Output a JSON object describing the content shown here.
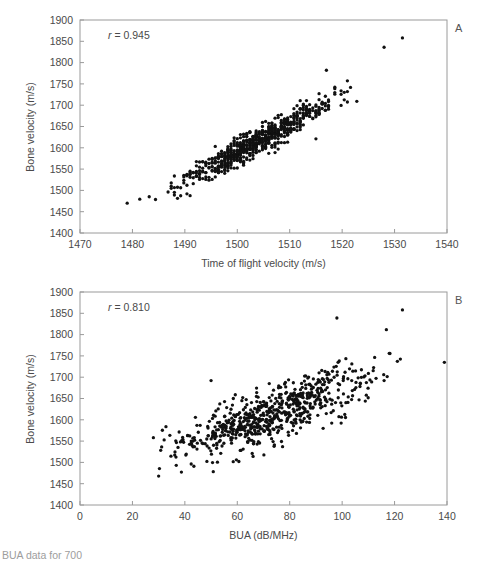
{
  "figure": {
    "caption_partial": "BUA data for 700",
    "marker_color": "#111111",
    "frame_color": "#9a9a9a",
    "background": "#ffffff"
  },
  "panels": [
    {
      "letter": "A",
      "annotation_r_symbol": "r",
      "annotation_equals": " = ",
      "annotation_value": "0.945",
      "r": 0.945,
      "xlabel": "Time of flight velocity (m/s)",
      "ylabel": "Bone velocity (m/s)",
      "xticks": [
        1470,
        1480,
        1490,
        1500,
        1510,
        1520,
        1530,
        1540
      ],
      "yticks": [
        1400,
        1450,
        1500,
        1550,
        1600,
        1650,
        1700,
        1750,
        1800,
        1850,
        1900
      ],
      "xlim": [
        1470,
        1540
      ],
      "ylim": [
        1400,
        1900
      ],
      "n_points": 700,
      "grid": false
    },
    {
      "letter": "B",
      "annotation_r_symbol": "r",
      "annotation_equals": " = ",
      "annotation_value": "0.810",
      "r": 0.81,
      "xlabel": "BUA (dB/MHz)",
      "ylabel": "Bone velocity (m/s)",
      "xticks": [
        0,
        20,
        40,
        60,
        80,
        100,
        120,
        140
      ],
      "yticks": [
        1400,
        1450,
        1500,
        1550,
        1600,
        1650,
        1700,
        1750,
        1800,
        1850,
        1900
      ],
      "xlim": [
        0,
        140
      ],
      "ylim": [
        1400,
        1900
      ],
      "n_points": 700,
      "grid": false
    }
  ],
  "chart_data": [
    {
      "type": "scatter",
      "panel": "A",
      "title": "",
      "xlabel": "Time of flight velocity (m/s)",
      "ylabel": "Bone velocity (m/s)",
      "xlim": [
        1470,
        1540
      ],
      "ylim": [
        1400,
        1900
      ],
      "xticks": [
        1470,
        1480,
        1490,
        1500,
        1510,
        1520,
        1530,
        1540
      ],
      "yticks": [
        1400,
        1450,
        1500,
        1550,
        1600,
        1650,
        1700,
        1750,
        1800,
        1850,
        1900
      ],
      "grid": false,
      "legend": null,
      "annotations": [
        "r = 0.945",
        "A"
      ],
      "correlation": 0.945,
      "n_points": 700,
      "x_mean": 1503.5,
      "x_sd": 7.2,
      "y_mean": 1612,
      "y_sd": 52,
      "x_quantized": true,
      "x_quantum": 0.6,
      "x_observed_range": [
        1479,
        1532
      ],
      "y_observed_range": [
        1470,
        1858
      ],
      "notable_points": [
        {
          "x": 1479,
          "y": 1470,
          "note": "isolated low outlier"
        },
        {
          "x": 1531.5,
          "y": 1858,
          "note": "high outlier"
        },
        {
          "x": 1528,
          "y": 1836,
          "note": "high outlier"
        },
        {
          "x": 1517,
          "y": 1782,
          "note": "upper edge point"
        },
        {
          "x": 1515,
          "y": 1621,
          "note": "low point at high x"
        }
      ]
    },
    {
      "type": "scatter",
      "panel": "B",
      "title": "",
      "xlabel": "BUA (dB/MHz)",
      "ylabel": "Bone velocity (m/s)",
      "xlim": [
        0,
        140
      ],
      "ylim": [
        1400,
        1900
      ],
      "xticks": [
        0,
        20,
        40,
        60,
        80,
        100,
        120,
        140
      ],
      "yticks": [
        1400,
        1450,
        1500,
        1550,
        1600,
        1650,
        1700,
        1750,
        1800,
        1850,
        1900
      ],
      "grid": false,
      "legend": null,
      "annotations": [
        "r = 0.810",
        "B"
      ],
      "correlation": 0.81,
      "n_points": 700,
      "x_mean": 72,
      "x_sd": 18,
      "y_mean": 1612,
      "y_sd": 52,
      "x_quantized": false,
      "x_observed_range": [
        27,
        139
      ],
      "y_observed_range": [
        1468,
        1858
      ],
      "notable_points": [
        {
          "x": 30,
          "y": 1468,
          "note": "isolated low outlier"
        },
        {
          "x": 123,
          "y": 1858,
          "note": "high outlier"
        },
        {
          "x": 98,
          "y": 1839,
          "note": "high outlier"
        },
        {
          "x": 50,
          "y": 1692,
          "note": "high-y at low x"
        },
        {
          "x": 139,
          "y": 1735,
          "note": "rightmost point"
        }
      ]
    }
  ]
}
